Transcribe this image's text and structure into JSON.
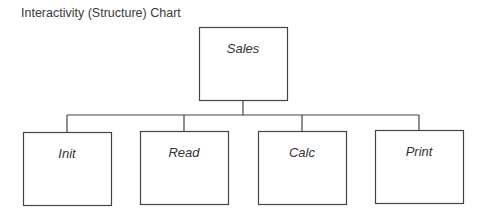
{
  "title": "Interactivity (Structure) Chart",
  "diagram": {
    "root": {
      "id": "sales",
      "label": "Sales"
    },
    "children": [
      {
        "id": "init",
        "label": "Init"
      },
      {
        "id": "read",
        "label": "Read"
      },
      {
        "id": "calc",
        "label": "Calc"
      },
      {
        "id": "print",
        "label": "Print"
      }
    ],
    "edges": [
      {
        "from": "sales",
        "to": "init"
      },
      {
        "from": "sales",
        "to": "read"
      },
      {
        "from": "sales",
        "to": "calc"
      },
      {
        "from": "sales",
        "to": "print"
      }
    ]
  },
  "colors": {
    "stroke": "#444444",
    "text": "#333333",
    "background": "#ffffff"
  }
}
